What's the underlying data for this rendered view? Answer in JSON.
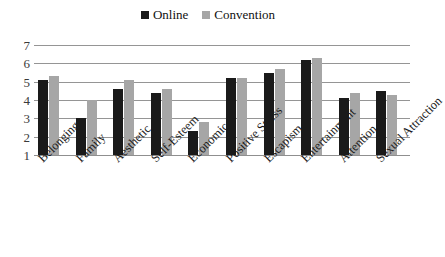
{
  "chart_data": {
    "type": "bar",
    "title": "",
    "xlabel": "",
    "ylabel": "",
    "ylim": [
      1,
      7
    ],
    "yticks": [
      1,
      2,
      3,
      4,
      5,
      6,
      7
    ],
    "grid": true,
    "legend_position": "top-center",
    "categories": [
      "Belonging",
      "Family",
      "Aesthetic",
      "Self-Esteem",
      "Economic",
      "Positive Stress",
      "Escapism",
      "Entertainment",
      "Attention",
      "Sexual Attraction"
    ],
    "series": [
      {
        "name": "Online",
        "color": "#1a1a1a",
        "values": [
          5.1,
          3.0,
          4.6,
          4.4,
          2.3,
          5.2,
          5.5,
          6.2,
          4.1,
          4.5
        ]
      },
      {
        "name": "Convention",
        "color": "#a6a6a6",
        "values": [
          5.3,
          4.0,
          5.1,
          4.6,
          2.8,
          5.2,
          5.7,
          6.3,
          4.4,
          4.3
        ]
      }
    ]
  },
  "legend": {
    "entries": [
      {
        "label": "Online",
        "color": "#1a1a1a",
        "swatch": "square-marker-dark"
      },
      {
        "label": "Convention",
        "color": "#a6a6a6",
        "swatch": "square-marker-gray"
      }
    ]
  },
  "axis": {
    "y_tick_labels": [
      "7",
      "6",
      "5",
      "4",
      "3",
      "2",
      "1"
    ]
  }
}
